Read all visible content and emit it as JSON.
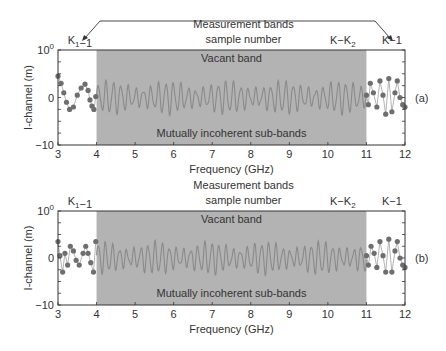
{
  "colors": {
    "shade": "#b3b3b3",
    "frame": "#333333",
    "trace": "#8a8a8a",
    "dot": "#6e6e6e",
    "text": "#333333"
  },
  "chart_data": [
    {
      "type": "line",
      "panel_label": "(a)",
      "title_line1": "Measurement bands",
      "title_line2": "sample number",
      "xlabel": "Frequency (GHz)",
      "ylabel": "I-channel (m)",
      "xlim": [
        3,
        12
      ],
      "ylim": [
        -10,
        10
      ],
      "xticks": [
        "3",
        "4",
        "5",
        "6",
        "7",
        "8",
        "9",
        "10",
        "11",
        "12"
      ],
      "yticks": [
        {
          "value": 10,
          "label": "10",
          "sup": "0"
        },
        {
          "value": 0,
          "label": "0",
          "sup": ""
        },
        {
          "value": -10,
          "label": "−10",
          "sup": ""
        }
      ],
      "annotations": {
        "k1_label": "K₁−1",
        "kk2_label": "K−K₂",
        "k_label": "K−1",
        "vacant": "Vacant band",
        "incoherent": "Mutually incoherent sub-bands",
        "arrows": true
      },
      "shaded_band": [
        4,
        11
      ],
      "series": [
        {
          "name": "Lower measured band samples",
          "style": "dots",
          "x": [
            3.0,
            3.08,
            3.15,
            3.22,
            3.3,
            3.4,
            3.5,
            3.6,
            3.7,
            3.78,
            3.83,
            3.88,
            3.93,
            3.98
          ],
          "values": [
            4.5,
            3.0,
            1.0,
            -1.0,
            -2.5,
            -2.0,
            0.5,
            2.0,
            2.8,
            1.5,
            -0.5,
            -1.8,
            -2.5,
            0.2
          ]
        },
        {
          "name": "Vacant band (noisy reconstruction)",
          "style": "trace",
          "x_range": [
            4,
            11
          ],
          "cycles": 36,
          "amplitude": 3.2
        },
        {
          "name": "Upper measured band samples",
          "style": "dots",
          "x": [
            11.0,
            11.05,
            11.1,
            11.18,
            11.27,
            11.35,
            11.43,
            11.5,
            11.58,
            11.66,
            11.74,
            11.8,
            11.87,
            11.94,
            12.0
          ],
          "values": [
            0.5,
            -1.5,
            3.0,
            1.0,
            -2.0,
            3.5,
            0.5,
            -3.5,
            4.0,
            -3.0,
            1.0,
            3.5,
            0,
            -1.5,
            -2.0
          ]
        }
      ]
    },
    {
      "type": "line",
      "panel_label": "(b)",
      "title_line1": "Measurement bands",
      "title_line2": "sample number",
      "xlabel": "Frequency (GHz)",
      "ylabel": "I-channel (m)",
      "xlim": [
        3,
        12
      ],
      "ylim": [
        -10,
        10
      ],
      "xticks": [
        "3",
        "4",
        "5",
        "6",
        "7",
        "8",
        "9",
        "10",
        "11",
        "12"
      ],
      "yticks": [
        {
          "value": 10,
          "label": "10",
          "sup": "0"
        },
        {
          "value": 0,
          "label": "0",
          "sup": ""
        },
        {
          "value": -10,
          "label": "−10",
          "sup": ""
        }
      ],
      "annotations": {
        "k1_label": "K₁−1",
        "kk2_label": "K−K₂",
        "k_label": "K−1",
        "vacant": "Vacant band",
        "incoherent": "Mutually incoherent sub-bands",
        "arrows": false
      },
      "shaded_band": [
        4,
        11
      ],
      "series": [
        {
          "name": "Lower measured band samples",
          "style": "dots",
          "x": [
            3.0,
            3.05,
            3.12,
            3.18,
            3.25,
            3.32,
            3.4,
            3.47,
            3.55,
            3.65,
            3.72,
            3.78,
            3.85,
            3.92,
            3.98
          ],
          "values": [
            3.5,
            0.5,
            -3.0,
            1.0,
            -1.5,
            2.5,
            1.5,
            -0.5,
            -1.5,
            1.0,
            2.5,
            1.0,
            -1.0,
            -3.0,
            3.5
          ]
        },
        {
          "name": "Vacant band (noisy reconstruction)",
          "style": "trace",
          "x_range": [
            4,
            11
          ],
          "cycles": 38,
          "amplitude": 3.2
        },
        {
          "name": "Upper measured band samples",
          "style": "dots",
          "x": [
            11.0,
            11.05,
            11.12,
            11.2,
            11.27,
            11.35,
            11.43,
            11.5,
            11.58,
            11.66,
            11.74,
            11.8,
            11.87,
            11.94,
            12.0
          ],
          "values": [
            0.5,
            -1.5,
            2.5,
            1.0,
            -2.0,
            3.5,
            0.5,
            -3.0,
            4.0,
            -3.0,
            1.5,
            3.5,
            0,
            -1.5,
            -2.0
          ]
        }
      ]
    }
  ]
}
